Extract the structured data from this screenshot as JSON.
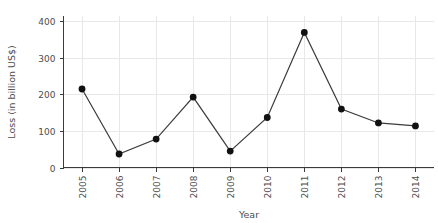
{
  "chart_data": {
    "type": "line",
    "title": "",
    "xlabel": "Year",
    "ylabel": "Loss (in billion US$)",
    "categories": [
      "2005",
      "2006",
      "2007",
      "2008",
      "2009",
      "2010",
      "2011",
      "2012",
      "2013",
      "2014"
    ],
    "values": [
      215,
      37,
      78,
      193,
      45,
      137,
      370,
      160,
      122,
      114
    ],
    "series": [
      {
        "name": "Loss (in billion US$)",
        "values": [
          215,
          37,
          78,
          193,
          45,
          137,
          370,
          160,
          122,
          114
        ]
      }
    ],
    "xlim": [
      2004.5,
      2014.5
    ],
    "ylim": [
      0,
      415
    ],
    "yticks": [
      0,
      100,
      200,
      300,
      400
    ],
    "ytick_labels": [
      "0",
      "100",
      "200",
      "300",
      "400"
    ],
    "xtick_labels": [
      "2005",
      "2006",
      "2007",
      "2008",
      "2009",
      "2010",
      "2011",
      "2012",
      "2013",
      "2014"
    ],
    "xtick_rotation": 90,
    "grid": true,
    "grid_axis": "both",
    "legend": false,
    "legend_position": "none",
    "marker": "circle",
    "line_color": "#3b3b3b",
    "marker_color": "#111111",
    "grid_color": "#e8e8ea",
    "axis_color": "#3a3a3a",
    "text_color": "#4d4d4d",
    "background_color": "#ffffff"
  }
}
